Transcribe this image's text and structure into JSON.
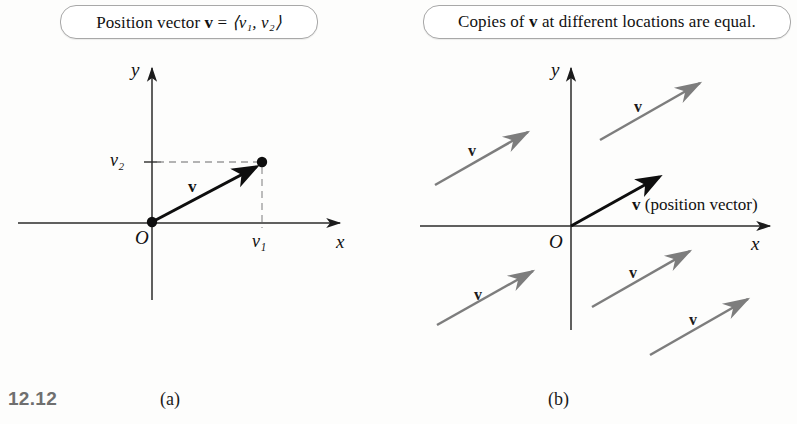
{
  "figure": {
    "number": "12.12",
    "panels": [
      {
        "id": "a",
        "letter": "(a)"
      },
      {
        "id": "b",
        "letter": "(b)"
      }
    ]
  },
  "callouts": {
    "a": {
      "text_prefix": "Position vector ",
      "vector_symbol": "v",
      "equals": " = ",
      "components": "⟨v₁, v₂⟩",
      "full_text": "Position vector v = ⟨v₁, v₂⟩"
    },
    "b": {
      "text_prefix": "Copies of ",
      "vector_symbol": "v",
      "text_suffix": " at different locations are equal.",
      "full_text": "Copies of v at different locations are equal."
    }
  },
  "panel_a": {
    "axes": {
      "x_label": "x",
      "y_label": "y",
      "origin_label": "O"
    },
    "components": {
      "x_component_label": "v₁",
      "y_component_label": "v₂"
    },
    "vector": {
      "label": "v",
      "color": "#111111",
      "from": "O",
      "to": "(v₁, v₂)"
    },
    "guides": {
      "style": "dashed",
      "color": "#9a9a9a"
    }
  },
  "panel_b": {
    "axes": {
      "x_label": "x",
      "y_label": "y",
      "origin_label": "O"
    },
    "position_vector": {
      "label": "v",
      "annotation": "(position vector)",
      "full_label": "v (position vector)",
      "color": "#111111"
    },
    "copy_color": "#7d7d7d",
    "copies": [
      {
        "id": "copy-upper-left",
        "label": "v",
        "quadrant": "II"
      },
      {
        "id": "copy-upper-right",
        "label": "v",
        "quadrant": "I"
      },
      {
        "id": "copy-lower-left",
        "label": "v",
        "quadrant": "III"
      },
      {
        "id": "copy-lower-mid",
        "label": "v",
        "quadrant": "IV"
      },
      {
        "id": "copy-lower-right",
        "label": "v",
        "quadrant": "IV"
      }
    ]
  },
  "colors": {
    "ink": "#111111",
    "gray_vector": "#7d7d7d",
    "axis": "#2b2b2b",
    "dashed_guide": "#9a9a9a",
    "callout_border": "#a8a8a8",
    "figure_number": "#6f6f6f",
    "background": "#fdfdfc"
  }
}
